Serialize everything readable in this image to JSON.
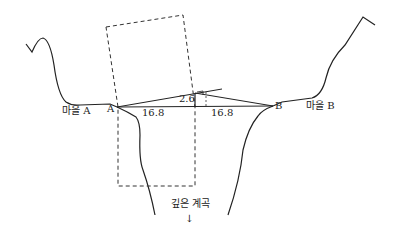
{
  "diagram": {
    "labels": {
      "village_a": "마을 A",
      "village_b": "마을 B",
      "point_a": "A",
      "point_b": "B",
      "dist_left": "16.8",
      "dist_right": "16.8",
      "height": "2.6",
      "valley": "깊은 계곡",
      "arrow": "↓"
    }
  }
}
